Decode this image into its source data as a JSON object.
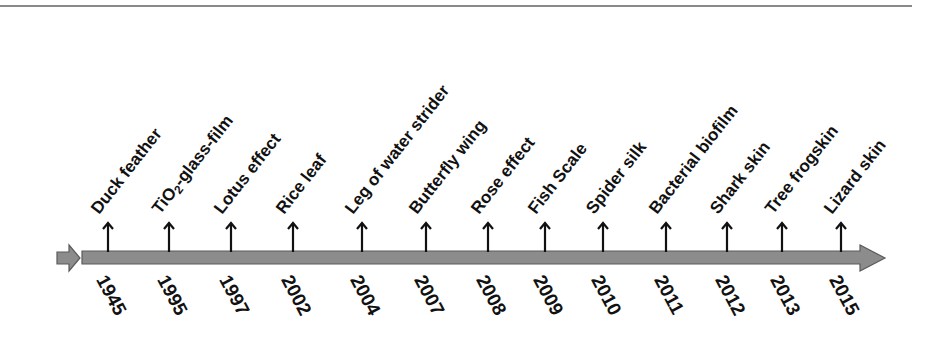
{
  "diagram": {
    "type": "timeline",
    "title": "",
    "colors": {
      "bar_fill": "#8c8c8c",
      "bar_stroke": "#5a5a5a",
      "text": "#111111",
      "rule": "#8a8a8a"
    },
    "events": [
      {
        "year": "1945",
        "label": "Duck feather",
        "x": 108
      },
      {
        "year": "1995",
        "label_pre": "TiO",
        "label_sub": "2",
        "label_post": "-glass-film",
        "label": "TiO2-glass-film",
        "x": 169
      },
      {
        "year": "1997",
        "label": "Lotus effect",
        "x": 231
      },
      {
        "year": "2002",
        "label": "Rice leaf",
        "x": 293
      },
      {
        "year": "2004",
        "label": "Leg of water strider",
        "x": 362
      },
      {
        "year": "2007",
        "label": "Butterfly wing",
        "x": 426
      },
      {
        "year": "2008",
        "label": "Rose effect",
        "x": 488
      },
      {
        "year": "2009",
        "label": "Fish Scale",
        "x": 545
      },
      {
        "year": "2010",
        "label": "Spider silk",
        "x": 603
      },
      {
        "year": "2011",
        "label": "Bacterial biofilm",
        "x": 666
      },
      {
        "year": "2012",
        "label": "Shark skin",
        "x": 727
      },
      {
        "year": "2013",
        "label": "Tree frogskin",
        "x": 782
      },
      {
        "year": "2015",
        "label": "Lizard skin",
        "x": 841
      }
    ]
  }
}
